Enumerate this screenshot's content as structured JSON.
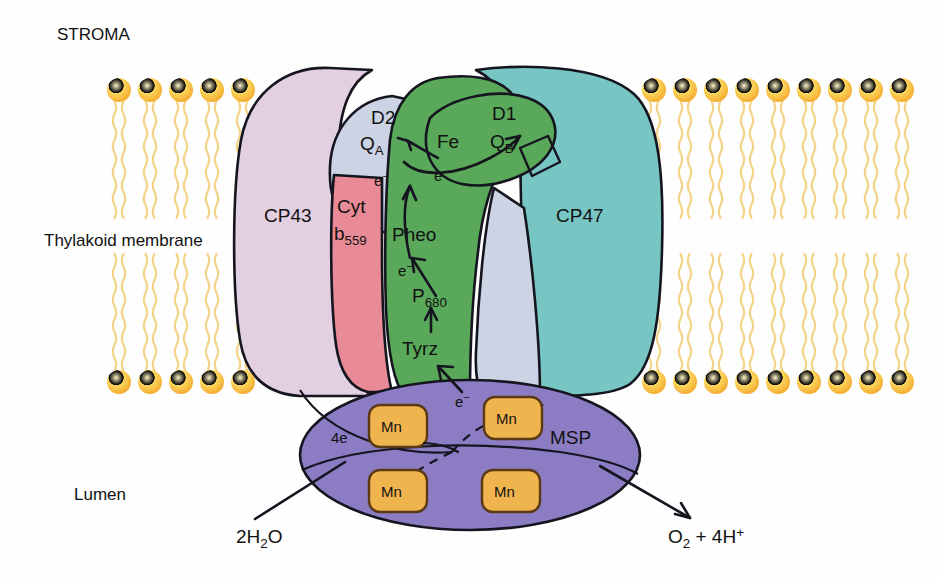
{
  "figure": {
    "type": "biological-diagram"
  },
  "regions": {
    "stroma": "STROMA",
    "membrane": "Thylakoid membrane",
    "lumen": "Lumen"
  },
  "subunits": {
    "cp43": {
      "label": "CP43",
      "color": "#e3cfe2"
    },
    "cp47": {
      "label": "CP47",
      "color": "#78c6c4"
    },
    "d1": {
      "label": "D1",
      "color": "#5aa85a"
    },
    "d2": {
      "label": "D2",
      "color": "#ccd3e4"
    },
    "cyt": {
      "label_line1": "Cyt",
      "label_line2": "b",
      "label_sub": "559",
      "color": "#e98b96"
    },
    "msp": {
      "label": "MSP",
      "color": "#8b7cc4"
    }
  },
  "cofactors": {
    "qa": {
      "base": "Q",
      "sub": "A"
    },
    "qb": {
      "base": "Q",
      "sub": "B"
    },
    "fe": {
      "label": "Fe"
    },
    "pheo": {
      "label": "Pheo"
    },
    "p680": {
      "base": "P",
      "sub": "680"
    },
    "tyrz": {
      "label": "Tyrz"
    },
    "mn": {
      "label": "Mn",
      "count": 4,
      "color": "#f0b44e"
    }
  },
  "electron_labels": {
    "e1": {
      "base": "e",
      "sup": "−"
    },
    "e2": {
      "base": "e",
      "sup": "−"
    },
    "e3": {
      "base": "e",
      "sup": "−"
    },
    "e4": {
      "base": "e",
      "sup": "−"
    },
    "four_e": {
      "base": "4e",
      "sup": "−"
    }
  },
  "reaction": {
    "substrate": {
      "base": "2H",
      "sub": "2",
      "tail": "O"
    },
    "products": {
      "o": "O",
      "o_sub": "2",
      "plus": " + 4H",
      "h_sup": "+"
    }
  },
  "membrane": {
    "lipid_head_color": "#f9c440",
    "lipid_tail_color": "#f3d48a",
    "head_radius": 12,
    "upper_head_y": 90,
    "lower_head_y": 382
  },
  "colors": {
    "outline": "#15151f",
    "background": "#ffffff",
    "text": "#111111"
  }
}
